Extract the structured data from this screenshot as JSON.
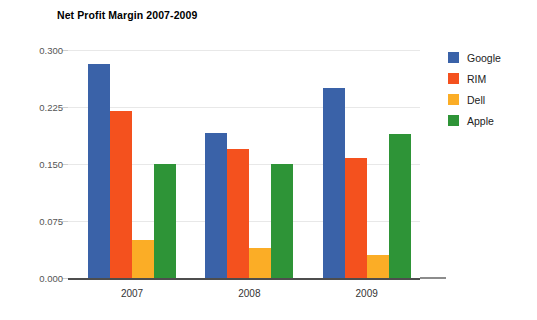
{
  "chart_data": {
    "type": "bar",
    "title": "Net Profit Margin 2007-2009",
    "xlabel": "",
    "ylabel": "",
    "categories": [
      "2007",
      "2008",
      "2009"
    ],
    "series": [
      {
        "name": "Google",
        "color": "#3a62a8",
        "values": [
          0.281,
          0.191,
          0.25
        ]
      },
      {
        "name": "RIM",
        "color": "#f4511e",
        "values": [
          0.22,
          0.17,
          0.158
        ]
      },
      {
        "name": "Dell",
        "color": "#fbad26",
        "values": [
          0.05,
          0.04,
          0.03
        ]
      },
      {
        "name": "Apple",
        "color": "#2e9437",
        "values": [
          0.15,
          0.15,
          0.19
        ]
      }
    ],
    "ylim": [
      0.0,
      0.3
    ],
    "yticks": [
      0.0,
      0.075,
      0.15,
      0.225,
      0.3
    ],
    "ytick_labels": [
      "0.000",
      "0.075",
      "0.150",
      "0.225",
      "0.300"
    ],
    "grid": true,
    "legend_position": "right"
  },
  "legend": {
    "items": [
      {
        "label": "Google",
        "color": "#3a62a8"
      },
      {
        "label": "RIM",
        "color": "#f4511e"
      },
      {
        "label": "Dell",
        "color": "#fbad26"
      },
      {
        "label": "Apple",
        "color": "#2e9437"
      }
    ]
  }
}
